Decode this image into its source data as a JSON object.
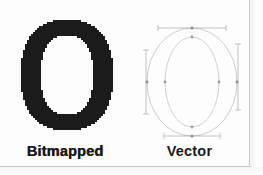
{
  "figure": {
    "background_color": "#fdfdfd",
    "ink_color": "#1b1b1b",
    "outline_color": "#b0b0b0",
    "scan_edge_color": "#c9c9c9"
  },
  "panels": {
    "bitmap": {
      "caption": "Bitmapped",
      "glyph": "O",
      "render_style": "aliased-raster",
      "fill_color": "#1b1b1b",
      "description": "Solid black letter O with jagged stair-stepped pixel edges"
    },
    "vector": {
      "caption": "Vector",
      "glyph": "O",
      "render_style": "bezier-outline",
      "stroke_color": "#b5b5b5",
      "anchor_color": "#9a9a9a",
      "handle_color": "#a8a8a8",
      "description": "Hairline outline letter O with bezier anchor points and tangent control handles"
    }
  }
}
